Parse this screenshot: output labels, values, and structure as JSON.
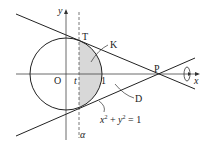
{
  "diagram": {
    "labels": {
      "y_axis": "y",
      "x_axis": "x",
      "origin": "O",
      "t_mark": "t",
      "one_mark": "1",
      "point_T": "T",
      "point_P": "P",
      "region_K": "K",
      "region_D": "D",
      "alpha": "α",
      "circle_eq_x": "x",
      "circle_eq_sup1": "2",
      "circle_eq_plus": " + ",
      "circle_eq_y": "y",
      "circle_eq_sup2": "2",
      "circle_eq_rhs": " = 1"
    },
    "colors": {
      "stroke": "#222222",
      "shade": "#d8d8d8",
      "dashed": "#555555"
    }
  }
}
